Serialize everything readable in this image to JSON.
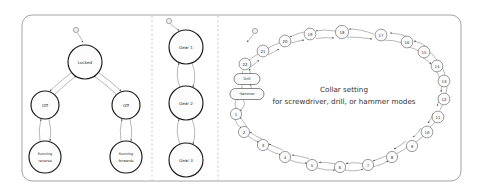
{
  "figure": {
    "background_color": "#ffffff",
    "border_color": "#8d8d8d",
    "divider_color": "#b5b5b5",
    "node_stroke_color": "#1a1a1a",
    "edge_color": "#6f6f6f",
    "text_color": "#2b2b2b"
  },
  "panels": [
    {
      "id": "motor",
      "name": "motor-state-panel",
      "start_marker": "initial-state-dot",
      "states": [
        {
          "id": "locked",
          "label": "Locked",
          "cx": 85,
          "cy": 62,
          "r": 17
        },
        {
          "id": "off_left",
          "label": "Off",
          "cx": 45,
          "cy": 105,
          "r": 14
        },
        {
          "id": "off_right",
          "label": "Off",
          "cx": 126,
          "cy": 105,
          "r": 14
        },
        {
          "id": "running_reverse",
          "label_line1": "Running",
          "label_line2": "reverse",
          "cx": 45,
          "cy": 157,
          "r": 16
        },
        {
          "id": "running_forwards",
          "label_line1": "Running",
          "label_line2": "forwards",
          "cx": 126,
          "cy": 157,
          "r": 16
        }
      ]
    },
    {
      "id": "gears",
      "name": "gear-state-panel",
      "start_marker": "initial-state-dot",
      "states": [
        {
          "id": "gear1",
          "label": "Gear 1",
          "cx": 186,
          "cy": 47,
          "r": 17
        },
        {
          "id": "gear2",
          "label": "Gear 2",
          "cx": 186,
          "cy": 103,
          "r": 17
        },
        {
          "id": "gear3",
          "label": "Gear 3",
          "cx": 186,
          "cy": 160,
          "r": 17
        }
      ]
    },
    {
      "id": "collar",
      "name": "collar-setting-panel",
      "start_marker": "initial-state-dot",
      "center_text_line1": "Collar setting",
      "center_text_line2": "for screwdriver, drill, or hammer modes",
      "mode_states": [
        {
          "id": "drill",
          "label": "Drill",
          "cx": 247,
          "cy": 79,
          "rx": 13,
          "ry": 5.5
        },
        {
          "id": "hammer",
          "label": "Hammer",
          "cx": 247,
          "cy": 94,
          "rx": 17,
          "ry": 5.5
        }
      ],
      "numbered_states": [
        {
          "label": "1",
          "cx": 236,
          "cy": 114
        },
        {
          "label": "2",
          "cx": 244,
          "cy": 132
        },
        {
          "label": "3",
          "cx": 263,
          "cy": 145
        },
        {
          "label": "4",
          "cx": 285,
          "cy": 157
        },
        {
          "label": "5",
          "cx": 312,
          "cy": 165
        },
        {
          "label": "6",
          "cx": 340,
          "cy": 167
        },
        {
          "label": "7",
          "cx": 368,
          "cy": 165
        },
        {
          "label": "8",
          "cx": 392,
          "cy": 157
        },
        {
          "label": "9",
          "cx": 412,
          "cy": 146
        },
        {
          "label": "10",
          "cx": 427,
          "cy": 132
        },
        {
          "label": "11",
          "cx": 438,
          "cy": 117
        },
        {
          "label": "12",
          "cx": 444,
          "cy": 99
        },
        {
          "label": "13",
          "cx": 444,
          "cy": 81
        },
        {
          "label": "14",
          "cx": 437,
          "cy": 66
        },
        {
          "label": "15",
          "cx": 424,
          "cy": 52
        },
        {
          "label": "16",
          "cx": 407,
          "cy": 42
        },
        {
          "label": "17",
          "cx": 381,
          "cy": 35
        },
        {
          "label": "18",
          "cx": 342,
          "cy": 32
        },
        {
          "label": "19",
          "cx": 310,
          "cy": 34
        },
        {
          "label": "20",
          "cx": 285,
          "cy": 41
        },
        {
          "label": "21",
          "cx": 263,
          "cy": 51
        },
        {
          "label": "22",
          "cx": 245,
          "cy": 64
        }
      ]
    }
  ]
}
